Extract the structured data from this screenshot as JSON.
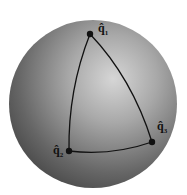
{
  "diagram": {
    "type": "spherical-triangle-on-sphere",
    "sphere": {
      "cx": 93,
      "cy": 104,
      "r": 84,
      "color_light": "#d8d8d8",
      "color_dark": "#4a4a4a"
    },
    "points": [
      {
        "id": "q1",
        "label": "q̂",
        "subscript": "1",
        "x": 90,
        "y": 34
      },
      {
        "id": "q2",
        "label": "q̂",
        "subscript": "2",
        "x": 69,
        "y": 151
      },
      {
        "id": "q3",
        "label": "q̂",
        "subscript": "3",
        "x": 152,
        "y": 142
      }
    ],
    "edge_color": "#111111"
  }
}
